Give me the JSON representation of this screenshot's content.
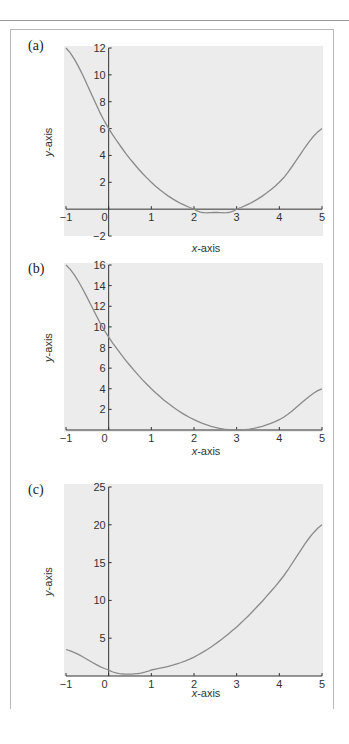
{
  "chart_data": [
    {
      "panel": "(a)",
      "type": "line",
      "title": "",
      "xlabel": "x-axis",
      "ylabel": "y-axis",
      "xlim": [
        -1,
        5
      ],
      "ylim": [
        -2,
        12
      ],
      "xticks": [
        -1,
        0,
        1,
        2,
        3,
        4,
        5
      ],
      "yticks": [
        -2,
        2,
        4,
        6,
        8,
        10,
        12
      ],
      "grid": false,
      "legend": null,
      "equation_estimate": "y = x^2 - 5x + 6",
      "series": [
        {
          "name": "curve",
          "x": [
            -1,
            0,
            1,
            2,
            2.5,
            3,
            4,
            5
          ],
          "y": [
            12,
            6,
            2,
            0,
            -0.25,
            0,
            2,
            6
          ]
        }
      ]
    },
    {
      "panel": "(b)",
      "type": "line",
      "title": "",
      "xlabel": "x-axis",
      "ylabel": "y-axis",
      "xlim": [
        -1,
        5
      ],
      "ylim": [
        0,
        16
      ],
      "xticks": [
        -1,
        0,
        1,
        2,
        3,
        4,
        5
      ],
      "yticks": [
        2,
        4,
        6,
        8,
        10,
        12,
        14,
        16
      ],
      "grid": false,
      "legend": null,
      "equation_estimate": "y = x^2 - 6x + 9",
      "series": [
        {
          "name": "curve",
          "x": [
            -1,
            0,
            1,
            2,
            3,
            4,
            5
          ],
          "y": [
            16,
            9,
            4,
            1,
            0,
            1,
            4
          ]
        }
      ]
    },
    {
      "panel": "(c)",
      "type": "line",
      "title": "",
      "xlabel": "x-axis",
      "ylabel": "y-axis",
      "xlim": [
        -1,
        5
      ],
      "ylim": [
        0,
        25
      ],
      "xticks": [
        -1,
        0,
        1,
        2,
        3,
        4,
        5
      ],
      "yticks": [
        5,
        10,
        15,
        20,
        25
      ],
      "grid": false,
      "legend": null,
      "equation_estimate": "y ≈ x^2 - x + 0.5",
      "series": [
        {
          "name": "curve",
          "x": [
            -1,
            0,
            0.5,
            1,
            2,
            3,
            4,
            5
          ],
          "y": [
            3.5,
            0.8,
            0.25,
            0.8,
            2.5,
            6.5,
            12.5,
            20
          ]
        }
      ]
    }
  ],
  "panels": [
    {
      "label": "(a)"
    },
    {
      "label": "(b)"
    },
    {
      "label": "(c)"
    }
  ],
  "colors": {
    "plot_bg": "#ececec",
    "curve": "#8a8a8a",
    "axis": "#333333"
  }
}
